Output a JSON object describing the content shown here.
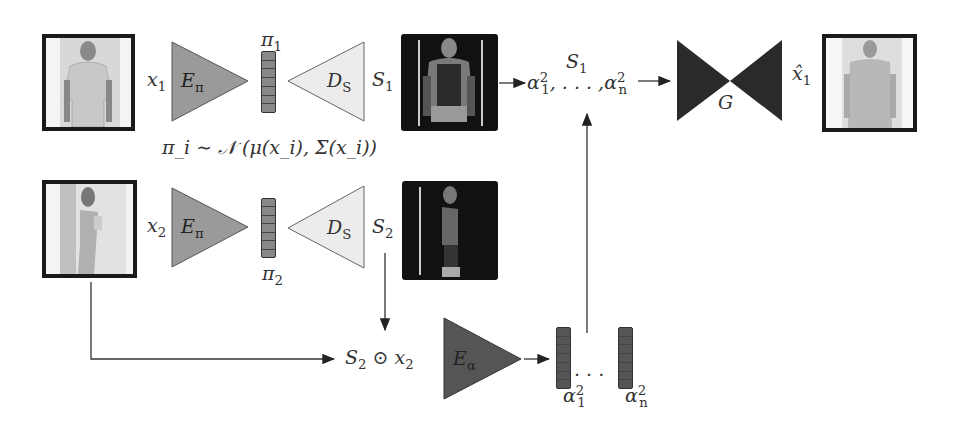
{
  "figure": {
    "row1": {
      "input_label": "x",
      "input_sub": "1",
      "encoder_label": "E",
      "encoder_sub": "π",
      "latent_label": "π",
      "latent_sub": "1",
      "decoder_label": "D",
      "decoder_sub": "S",
      "seg_label": "S",
      "seg_sub": "1"
    },
    "row2": {
      "input_label": "x",
      "input_sub": "2",
      "encoder_label": "E",
      "encoder_sub": "π",
      "latent_label": "π",
      "latent_sub": "2",
      "decoder_label": "D",
      "decoder_sub": "S",
      "seg_label": "S",
      "seg_sub": "2"
    },
    "distribution": "π_i ∼ 𝒩 (μ(x_i), Σ(x_i))",
    "masked_input": {
      "s": "S",
      "s_sub": "2",
      "op": "⊙",
      "x": "x",
      "x_sub": "2"
    },
    "appearance_encoder": {
      "label": "E",
      "sub": "α"
    },
    "appearance_vectors": {
      "first": "α",
      "first_sub": "1",
      "first_sup": "2",
      "ellipsis": "· · ·",
      "last": "α",
      "last_sub": "n",
      "last_sup": "2"
    },
    "generator_input": {
      "top": "S",
      "top_sub": "1",
      "first": "α",
      "first_sub": "1",
      "sup": "2",
      "ellipsis": ", . . . ,",
      "last": "α",
      "last_sub": "n"
    },
    "generator": {
      "label": "G"
    },
    "output": {
      "label": "x̂",
      "sub": "1"
    },
    "colors": {
      "encoder_pi": "#9a9a9a",
      "decoder_s": "#ececec",
      "encoder_alpha": "#555555",
      "generator": "#2a2a2a",
      "frame": "#1a1a1a",
      "seg_bg": "#111111"
    }
  }
}
